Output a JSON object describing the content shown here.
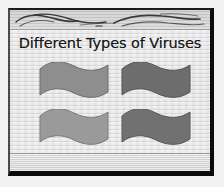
{
  "slide": {
    "title": "Different Types of Viruses",
    "background_color": "#dedede",
    "border_color": "#0c0c0c",
    "title_color": "#17181a",
    "header_band": {
      "name": "decorative-brush-band",
      "fill_color": "#cfcfcf",
      "stroke_color": "#3a3a3a"
    },
    "footer": {
      "rule_color": "#6e6e6e"
    },
    "flags": [
      {
        "id": "flag-1",
        "position": "top-left",
        "color": "#8e8e8e",
        "outline": "#6f6f6f"
      },
      {
        "id": "flag-2",
        "position": "top-right",
        "color": "#6d6d6d",
        "outline": "#555555"
      },
      {
        "id": "flag-3",
        "position": "bottom-left",
        "color": "#9a9a9a",
        "outline": "#7b7b7b"
      },
      {
        "id": "flag-4",
        "position": "bottom-right",
        "color": "#717171",
        "outline": "#585858"
      }
    ]
  }
}
